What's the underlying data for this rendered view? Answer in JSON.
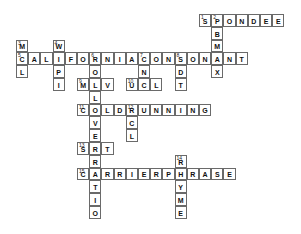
{
  "puzzle": {
    "grid": {
      "origin_x": 16,
      "origin_y": 14,
      "cell_w": 12.2,
      "cell_h": 12.8
    },
    "entries": [
      {
        "number": 1,
        "direction": "across",
        "answer": "SPONDEE",
        "row": 0,
        "col": 15
      },
      {
        "number": 2,
        "direction": "down",
        "answer": "PBMAX",
        "row": 0,
        "col": 16
      },
      {
        "number": 3,
        "direction": "down",
        "answer": "MCL",
        "row": 2,
        "col": 0
      },
      {
        "number": 4,
        "direction": "down",
        "answer": "WIPI",
        "row": 2,
        "col": 3
      },
      {
        "number": 5,
        "direction": "across",
        "answer": "CALIFORNIACONSONANT",
        "row": 3,
        "col": 0
      },
      {
        "number": 6,
        "direction": "down",
        "answer": "ROLLOVERRATIO",
        "row": 3,
        "col": 6
      },
      {
        "number": 7,
        "direction": "down",
        "answer": "CNC",
        "row": 3,
        "col": 10
      },
      {
        "number": 8,
        "direction": "down",
        "answer": "SDT",
        "row": 3,
        "col": 13
      },
      {
        "number": 9,
        "direction": "across",
        "answer": "MLV",
        "row": 5,
        "col": 5
      },
      {
        "number": 10,
        "direction": "across",
        "answer": "UCL",
        "row": 5,
        "col": 9
      },
      {
        "number": 11,
        "direction": "across",
        "answer": "COLDRUNNING",
        "row": 7,
        "col": 5
      },
      {
        "number": 12,
        "direction": "down",
        "answer": "RCL",
        "row": 7,
        "col": 9
      },
      {
        "number": 13,
        "direction": "across",
        "answer": "SRT",
        "row": 10,
        "col": 5
      },
      {
        "number": 14,
        "direction": "down",
        "answer": "RHYME",
        "row": 11,
        "col": 13
      },
      {
        "number": 15,
        "direction": "across",
        "answer": "CARRIERPHRASE",
        "row": 12,
        "col": 5
      }
    ]
  }
}
